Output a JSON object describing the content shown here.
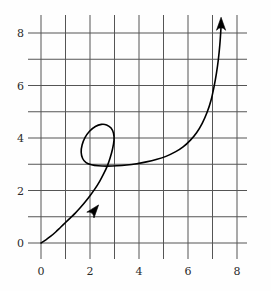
{
  "figure": {
    "background_color": "#fefefe",
    "width": 271,
    "height": 291
  },
  "chart_data": {
    "type": "line",
    "title": "",
    "subtitle": "",
    "xlabel": "",
    "ylabel": "",
    "xlim": [
      -0.4,
      8.4
    ],
    "ylim": [
      -0.6,
      8.8
    ],
    "grid": true,
    "grid_color": "#555555",
    "grid_spacing": 1,
    "legend": null,
    "legend_position": "none",
    "curve_color": "#000000",
    "curve_label": "parametric curve with loop",
    "x_ticks": [
      0,
      1,
      2,
      3,
      4,
      5,
      6,
      7,
      8
    ],
    "y_ticks": [
      0,
      1,
      2,
      3,
      4,
      5,
      6,
      7,
      8
    ],
    "x_tick_labels": [
      "0",
      "",
      "2",
      "",
      "4",
      "",
      "6",
      "",
      "8"
    ],
    "y_tick_labels": [
      "0",
      "",
      "2",
      "",
      "4",
      "",
      "6",
      "",
      "8"
    ],
    "x_labeled_values": [
      0,
      2,
      4,
      6,
      8
    ],
    "y_labeled_values": [
      0,
      2,
      4,
      6,
      8
    ],
    "annotations": [
      {
        "name": "mid-curve-arrow",
        "x": 2.35,
        "y": 1.45,
        "direction": "up-right",
        "note": "direction of travel marker on ascending branch"
      },
      {
        "name": "terminal-arrow",
        "x": 7.35,
        "y": 8.6,
        "direction": "up",
        "note": "arrowhead at end of curve"
      }
    ],
    "points": [
      [
        0.0,
        0.0
      ],
      [
        0.2,
        0.12
      ],
      [
        0.4,
        0.26
      ],
      [
        0.6,
        0.42
      ],
      [
        0.8,
        0.6
      ],
      [
        1.0,
        0.78
      ],
      [
        1.2,
        0.96
      ],
      [
        1.4,
        1.14
      ],
      [
        1.6,
        1.34
      ],
      [
        1.8,
        1.56
      ],
      [
        2.0,
        1.8
      ],
      [
        2.2,
        2.06
      ],
      [
        2.4,
        2.36
      ],
      [
        2.55,
        2.62
      ],
      [
        2.7,
        2.92
      ],
      [
        2.82,
        3.24
      ],
      [
        2.92,
        3.58
      ],
      [
        2.98,
        3.92
      ],
      [
        2.96,
        4.18
      ],
      [
        2.86,
        4.38
      ],
      [
        2.68,
        4.5
      ],
      [
        2.46,
        4.52
      ],
      [
        2.22,
        4.44
      ],
      [
        1.98,
        4.26
      ],
      [
        1.8,
        4.02
      ],
      [
        1.68,
        3.74
      ],
      [
        1.64,
        3.46
      ],
      [
        1.7,
        3.22
      ],
      [
        1.84,
        3.06
      ],
      [
        2.06,
        2.98
      ],
      [
        2.34,
        2.94
      ],
      [
        2.7,
        2.93
      ],
      [
        3.1,
        2.94
      ],
      [
        3.5,
        2.97
      ],
      [
        3.9,
        3.02
      ],
      [
        4.3,
        3.09
      ],
      [
        4.7,
        3.18
      ],
      [
        5.1,
        3.3
      ],
      [
        5.5,
        3.48
      ],
      [
        5.8,
        3.66
      ],
      [
        6.1,
        3.92
      ],
      [
        6.35,
        4.2
      ],
      [
        6.58,
        4.56
      ],
      [
        6.78,
        4.98
      ],
      [
        6.94,
        5.44
      ],
      [
        7.06,
        5.94
      ],
      [
        7.16,
        6.46
      ],
      [
        7.24,
        7.0
      ],
      [
        7.3,
        7.56
      ],
      [
        7.34,
        8.1
      ],
      [
        7.36,
        8.45
      ]
    ]
  }
}
